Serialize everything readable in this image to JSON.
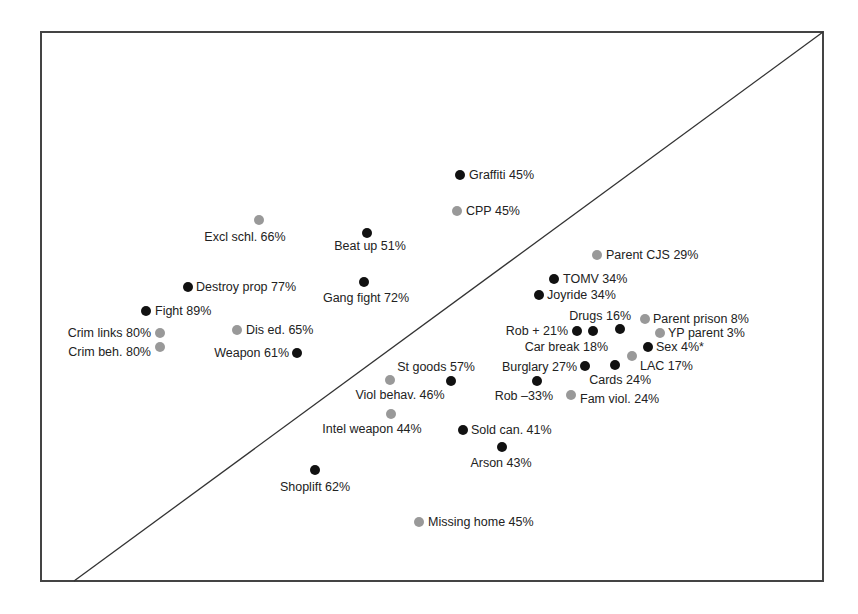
{
  "chart_data": {
    "type": "scatter",
    "title": "",
    "xlabel": "",
    "ylabel": "",
    "xlim": [
      0,
      100
    ],
    "ylim": [
      0,
      100
    ],
    "grid": false,
    "legend": null,
    "reference_line": {
      "type": "diagonal",
      "from": [
        4.2,
        0
      ],
      "to": [
        100,
        100
      ]
    },
    "colors": {
      "dark": "#111111",
      "gray": "#999999",
      "frame": "#444444",
      "text": "#222222"
    },
    "points": [
      {
        "label": "Graffiti 45%",
        "x": 53.6,
        "y": 73.8,
        "color": "dark",
        "anchor": "right"
      },
      {
        "label": "CPP 45%",
        "x": 53.2,
        "y": 67.4,
        "color": "gray",
        "anchor": "right"
      },
      {
        "label": "Excl schl. 66%",
        "x": 27.9,
        "y": 65.7,
        "color": "gray",
        "anchor": "below-left"
      },
      {
        "label": "Beat up 51%",
        "x": 41.7,
        "y": 63.4,
        "color": "dark",
        "anchor": "below"
      },
      {
        "label": "Destroy prop 77%",
        "x": 18.8,
        "y": 53.6,
        "color": "dark",
        "anchor": "right"
      },
      {
        "label": "Gang fight 72%",
        "x": 41.3,
        "y": 54.5,
        "color": "dark",
        "anchor": "below"
      },
      {
        "label": "Fight 89%",
        "x": 13.4,
        "y": 49.2,
        "color": "dark",
        "anchor": "right"
      },
      {
        "label": "Crim links 80%",
        "x": 15.2,
        "y": 45.2,
        "color": "gray",
        "anchor": "left"
      },
      {
        "label": "Crim beh. 80%",
        "x": 15.2,
        "y": 42.6,
        "color": "gray",
        "anchor": "left"
      },
      {
        "label": "Dis ed. 65%",
        "x": 25.1,
        "y": 45.7,
        "color": "gray",
        "anchor": "right"
      },
      {
        "label": "Weapon 61%",
        "x": 32.7,
        "y": 41.5,
        "color": "dark",
        "anchor": "left"
      },
      {
        "label": "Parent CJS 29%",
        "x": 71.1,
        "y": 59.4,
        "color": "gray",
        "anchor": "right"
      },
      {
        "label": "TOMV 34%",
        "x": 65.6,
        "y": 55.0,
        "color": "dark",
        "anchor": "right"
      },
      {
        "label": "Joyride 34%",
        "x": 63.7,
        "y": 52.1,
        "color": "dark",
        "anchor": "right"
      },
      {
        "label": "Drugs 16%",
        "x": 74.0,
        "y": 46.1,
        "color": "dark",
        "anchor": "above-left"
      },
      {
        "label": "Parent prison 8%",
        "x": 77.2,
        "y": 47.9,
        "color": "gray",
        "anchor": "right"
      },
      {
        "label": "Rob + 21%",
        "x": 68.5,
        "y": 45.7,
        "color": "dark",
        "anchor": "left"
      },
      {
        "label": "Car break 18%",
        "x": 70.6,
        "y": 45.7,
        "color": "dark",
        "anchor": "below-left"
      },
      {
        "label": "YP parent 3%",
        "x": 79.2,
        "y": 45.2,
        "color": "gray",
        "anchor": "right"
      },
      {
        "label": "Sex 4%*",
        "x": 77.6,
        "y": 42.6,
        "color": "dark",
        "anchor": "right"
      },
      {
        "label": "LAC 17%",
        "x": 75.6,
        "y": 41.0,
        "color": "gray",
        "anchor": "below-right"
      },
      {
        "label": "Burglary 27%",
        "x": 69.6,
        "y": 39.0,
        "color": "dark",
        "anchor": "left"
      },
      {
        "label": "Cards 24%",
        "x": 73.4,
        "y": 39.2,
        "color": "dark",
        "anchor": "below"
      },
      {
        "label": "St goods 57%",
        "x": 52.4,
        "y": 36.4,
        "color": "dark",
        "anchor": "above-left"
      },
      {
        "label": "Viol behav. 46%",
        "x": 44.6,
        "y": 36.6,
        "color": "gray",
        "anchor": "below"
      },
      {
        "label": "Rob –33%",
        "x": 63.4,
        "y": 36.4,
        "color": "dark",
        "anchor": "below-left"
      },
      {
        "label": "Fam viol. 24%",
        "x": 67.8,
        "y": 33.9,
        "color": "gray",
        "anchor": "below-right"
      },
      {
        "label": "Intel weapon 44%",
        "x": 44.8,
        "y": 30.4,
        "color": "gray",
        "anchor": "below"
      },
      {
        "label": "Sold can. 41%",
        "x": 53.9,
        "y": 27.5,
        "color": "dark",
        "anchor": "right"
      },
      {
        "label": "Arson 43%",
        "x": 58.9,
        "y": 24.4,
        "color": "dark",
        "anchor": "below"
      },
      {
        "label": "Shoplift 62%",
        "x": 35.0,
        "y": 20.2,
        "color": "dark",
        "anchor": "below"
      },
      {
        "label": "Missing home 45%",
        "x": 48.3,
        "y": 10.7,
        "color": "gray",
        "anchor": "right"
      }
    ]
  },
  "layout": {
    "frame": {
      "left": 41,
      "top": 32,
      "right": 823,
      "bottom": 581
    },
    "points_px": [
      {
        "cx": 460,
        "cy": 175,
        "tx": 469,
        "ty": 179,
        "ta": "start"
      },
      {
        "cx": 457,
        "cy": 211,
        "tx": 466,
        "ty": 215,
        "ta": "start"
      },
      {
        "cx": 259,
        "cy": 220,
        "tx": 245,
        "ty": 241,
        "ta": "middle"
      },
      {
        "cx": 367,
        "cy": 233,
        "tx": 370,
        "ty": 250,
        "ta": "middle"
      },
      {
        "cx": 188,
        "cy": 287,
        "tx": 196,
        "ty": 291,
        "ta": "start"
      },
      {
        "cx": 364,
        "cy": 282,
        "tx": 366,
        "ty": 302,
        "ta": "middle"
      },
      {
        "cx": 146,
        "cy": 311,
        "tx": 155,
        "ty": 315,
        "ta": "start"
      },
      {
        "cx": 160,
        "cy": 333,
        "tx": 151,
        "ty": 337,
        "ta": "end"
      },
      {
        "cx": 160,
        "cy": 347,
        "tx": 151,
        "ty": 356,
        "ta": "end"
      },
      {
        "cx": 237,
        "cy": 330,
        "tx": 246,
        "ty": 334,
        "ta": "start"
      },
      {
        "cx": 297,
        "cy": 353,
        "tx": 289,
        "ty": 357,
        "ta": "end"
      },
      {
        "cx": 597,
        "cy": 255,
        "tx": 606,
        "ty": 259,
        "ta": "start"
      },
      {
        "cx": 554,
        "cy": 279,
        "tx": 563,
        "ty": 283,
        "ta": "start"
      },
      {
        "cx": 539,
        "cy": 295,
        "tx": 547,
        "ty": 299,
        "ta": "start"
      },
      {
        "cx": 620,
        "cy": 329,
        "tx": 631,
        "ty": 320,
        "ta": "end"
      },
      {
        "cx": 645,
        "cy": 319,
        "tx": 653,
        "ty": 323,
        "ta": "start"
      },
      {
        "cx": 577,
        "cy": 331,
        "tx": 568,
        "ty": 335,
        "ta": "end"
      },
      {
        "cx": 593,
        "cy": 331,
        "tx": 608,
        "ty": 351,
        "ta": "end"
      },
      {
        "cx": 660,
        "cy": 333,
        "tx": 668,
        "ty": 337,
        "ta": "start"
      },
      {
        "cx": 648,
        "cy": 347,
        "tx": 656,
        "ty": 351,
        "ta": "start"
      },
      {
        "cx": 632,
        "cy": 356,
        "tx": 640,
        "ty": 370,
        "ta": "start"
      },
      {
        "cx": 585,
        "cy": 366,
        "tx": 577,
        "ty": 371,
        "ta": "end"
      },
      {
        "cx": 615,
        "cy": 365,
        "tx": 651,
        "ty": 384,
        "ta": "end"
      },
      {
        "cx": 451,
        "cy": 381,
        "tx": 475,
        "ty": 371,
        "ta": "end"
      },
      {
        "cx": 390,
        "cy": 380,
        "tx": 400,
        "ty": 399,
        "ta": "middle"
      },
      {
        "cx": 537,
        "cy": 381,
        "tx": 553,
        "ty": 400,
        "ta": "end"
      },
      {
        "cx": 571,
        "cy": 395,
        "tx": 580,
        "ty": 403,
        "ta": "start"
      },
      {
        "cx": 391,
        "cy": 414,
        "tx": 372,
        "ty": 433,
        "ta": "middle"
      },
      {
        "cx": 463,
        "cy": 430,
        "tx": 471,
        "ty": 434,
        "ta": "start"
      },
      {
        "cx": 502,
        "cy": 447,
        "tx": 501,
        "ty": 467,
        "ta": "middle"
      },
      {
        "cx": 315,
        "cy": 470,
        "tx": 315,
        "ty": 491,
        "ta": "middle"
      },
      {
        "cx": 419,
        "cy": 522,
        "tx": 428,
        "ty": 526,
        "ta": "start"
      }
    ]
  }
}
